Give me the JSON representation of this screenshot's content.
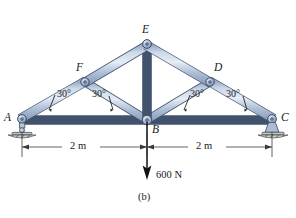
{
  "figure": {
    "caption": "(b)",
    "background_color": "#ffffff"
  },
  "colors": {
    "member_fill": "#aebdd4",
    "member_fill_light": "#ccd8e8",
    "member_fill_dark": "#8c9db8",
    "member_edge": "#4a5a74",
    "joint_pin": "#9aa9c0",
    "support_hatch": "#5a5a5a",
    "dimension_line": "#3a3a3a",
    "force_arrow": "#111111",
    "text": "#1a1a1a"
  },
  "joints": [
    {
      "id": "A",
      "label": "A",
      "x": 22,
      "y": 120,
      "support": "pin-roller"
    },
    {
      "id": "F",
      "label": "F",
      "x": 85,
      "y": 82,
      "support": "none"
    },
    {
      "id": "E",
      "label": "E",
      "x": 147,
      "y": 44,
      "support": "none"
    },
    {
      "id": "D",
      "label": "D",
      "x": 210,
      "y": 82,
      "support": "none"
    },
    {
      "id": "C",
      "label": "C",
      "x": 272,
      "y": 120,
      "support": "pin"
    },
    {
      "id": "B",
      "label": "B",
      "x": 147,
      "y": 120,
      "support": "none"
    }
  ],
  "joint_labels": [
    {
      "name": "joint-label-a",
      "text": "A",
      "left": 4,
      "top": 112
    },
    {
      "name": "joint-label-f",
      "text": "F",
      "left": 76,
      "top": 63
    },
    {
      "name": "joint-label-e",
      "text": "E",
      "left": 142,
      "top": 24
    },
    {
      "name": "joint-label-d",
      "text": "D",
      "left": 214,
      "top": 63
    },
    {
      "name": "joint-label-c",
      "text": "C",
      "left": 281,
      "top": 112
    },
    {
      "name": "joint-label-b",
      "text": "B",
      "left": 152,
      "top": 124
    }
  ],
  "members": [
    {
      "from": "A",
      "to": "F",
      "name": "member-af"
    },
    {
      "from": "F",
      "to": "E",
      "name": "member-fe"
    },
    {
      "from": "E",
      "to": "D",
      "name": "member-ed"
    },
    {
      "from": "D",
      "to": "C",
      "name": "member-dc"
    },
    {
      "from": "A",
      "to": "B",
      "name": "member-ab"
    },
    {
      "from": "B",
      "to": "C",
      "name": "member-bc"
    },
    {
      "from": "E",
      "to": "B",
      "name": "member-eb"
    },
    {
      "from": "F",
      "to": "B",
      "name": "member-fb"
    },
    {
      "from": "D",
      "to": "B",
      "name": "member-db"
    }
  ],
  "angles": [
    {
      "name": "angle-at-a",
      "text": "30°",
      "left": 57,
      "top": 96,
      "at_joint": "A",
      "value": 30,
      "unit": "degrees"
    },
    {
      "name": "angle-fb-at-b",
      "text": "30°",
      "left": 92,
      "top": 96,
      "at_joint": "B",
      "value": 30,
      "unit": "degrees"
    },
    {
      "name": "angle-db-at-b",
      "text": "30°",
      "left": 190,
      "top": 96,
      "at_joint": "B",
      "value": 30,
      "unit": "degrees"
    },
    {
      "name": "angle-at-c",
      "text": "30°",
      "left": 224,
      "top": 96,
      "at_joint": "C",
      "value": 30,
      "unit": "degrees"
    }
  ],
  "dimensions": [
    {
      "name": "dimension-left",
      "text": "2 m",
      "from": "A",
      "to": "B",
      "left": 70,
      "top": 141,
      "value": 2,
      "unit": "m"
    },
    {
      "name": "dimension-right",
      "text": "2 m",
      "from": "B",
      "to": "C",
      "left": 196,
      "top": 141,
      "value": 2,
      "unit": "m"
    }
  ],
  "load": {
    "name": "load-600n",
    "label": "600 N",
    "magnitude": 600,
    "unit": "N",
    "direction": "down",
    "applied_at": "B",
    "label_left": 158,
    "label_top": 170
  },
  "caption": {
    "text": "(b)",
    "left": 138,
    "top": 192
  }
}
